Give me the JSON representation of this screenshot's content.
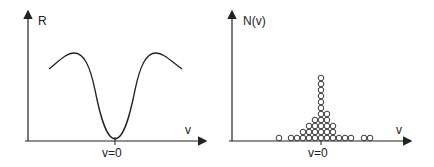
{
  "left_plot": {
    "y_label": "R",
    "x_label": "v",
    "origin_label": "v=0",
    "description": "Curve R(v) with a minimum at v=0 and maxima on either side"
  },
  "right_plot": {
    "y_label": "N(v)",
    "x_label": "v",
    "origin_label": "v=0",
    "description": "Histogram of circles centred at v=0",
    "columns": [
      {
        "x": 279,
        "count": 1
      },
      {
        "x": 291,
        "count": 1
      },
      {
        "x": 297,
        "count": 1
      },
      {
        "x": 303,
        "count": 2
      },
      {
        "x": 309,
        "count": 3
      },
      {
        "x": 315,
        "count": 4
      },
      {
        "x": 321,
        "count": 11
      },
      {
        "x": 327,
        "count": 5
      },
      {
        "x": 333,
        "count": 3
      },
      {
        "x": 339,
        "count": 1
      },
      {
        "x": 345,
        "count": 1
      },
      {
        "x": 351,
        "count": 1
      },
      {
        "x": 364,
        "count": 1
      },
      {
        "x": 370,
        "count": 1
      }
    ]
  },
  "colors": {
    "stroke": "#222222",
    "background": "#ffffff"
  }
}
